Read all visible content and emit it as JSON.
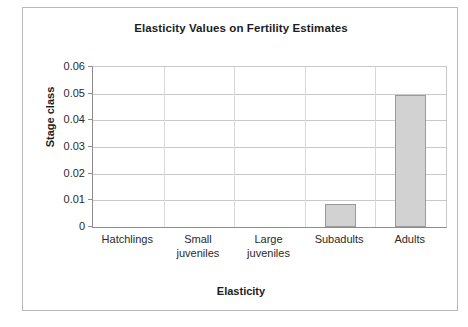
{
  "chart_data": {
    "type": "bar",
    "title": "Elasticity Values on Fertility Estimates",
    "xlabel": "Elasticity",
    "ylabel": "Stage class",
    "categories": [
      "Hatchlings",
      "Small juveniles",
      "Large juveniles",
      "Subadults",
      "Adults"
    ],
    "values": [
      0,
      0,
      0,
      0.0085,
      0.0497
    ],
    "ylim": [
      0,
      0.06
    ],
    "ytick_labels": [
      "0.06",
      "0.05",
      "0.04",
      "0.03",
      "0.02",
      "0.01",
      "0"
    ],
    "ytick_values": [
      0.06,
      0.05,
      0.04,
      0.03,
      0.02,
      0.01,
      0
    ],
    "grid": true,
    "legend": "none",
    "series": [
      {
        "name": "Elasticity",
        "values": [
          0,
          0,
          0,
          0.0085,
          0.0497
        ],
        "color": "#d2d2d2",
        "border_color": "#9a9a9a"
      }
    ],
    "category_label_lines": [
      [
        "Hatchlings"
      ],
      [
        "Small",
        "juveniles"
      ],
      [
        "Large",
        "juveniles"
      ],
      [
        "Subadults"
      ],
      [
        "Adults"
      ]
    ]
  },
  "colors": {
    "bar_fill": "#d2d2d2",
    "bar_stroke": "#9a9a9a",
    "gridline": "#c9c9c9",
    "axis": "#8d8d8d",
    "frame": "#b9b9b9",
    "text": "#1d1d1d",
    "background": "#ffffff"
  }
}
